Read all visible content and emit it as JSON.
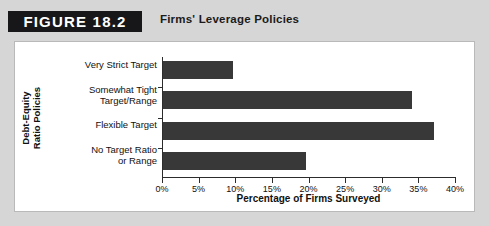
{
  "header": {
    "badge": "FIGURE 18.2",
    "title": "Firms' Leverage Policies"
  },
  "colors": {
    "bar": "#383838",
    "badge_bg": "#17171a",
    "panel_bg": "#ffffff",
    "outer_bg": "#d6d6d6",
    "axis": "#2c2c2c"
  },
  "chart_data": {
    "type": "bar",
    "orientation": "horizontal",
    "title": "Firms' Leverage Policies",
    "categories": [
      "Very Strict Target",
      "Somewhat Tight Target/Range",
      "Flexible Target",
      "No Target Ratio or Range"
    ],
    "category_lines": [
      [
        "Very Strict Target"
      ],
      [
        "Somewhat Tight",
        "Target/Range"
      ],
      [
        "Flexible Target"
      ],
      [
        "No Target Ratio",
        "or Range"
      ]
    ],
    "values": [
      9.5,
      34,
      37,
      19.5
    ],
    "xlabel": "Percentage of Firms Surveyed",
    "ylabel": "Debt-Equity Ratio Policies",
    "ylabel_lines": [
      "Debt-Equity",
      "Ratio Policies"
    ],
    "xlim": [
      0,
      40
    ],
    "xticks": [
      0,
      5,
      10,
      15,
      20,
      25,
      30,
      35,
      40
    ],
    "xtick_labels": [
      "0%",
      "5%",
      "10%",
      "15%",
      "20%",
      "25%",
      "30%",
      "35%",
      "40%"
    ],
    "grid": false,
    "legend": "none"
  }
}
